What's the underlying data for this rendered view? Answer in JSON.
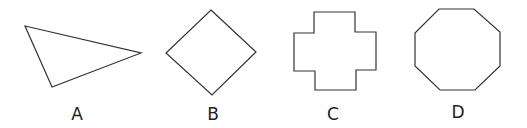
{
  "figure": {
    "stroke_color": "#333333",
    "shapes": [
      {
        "label": "A",
        "name": "triangle",
        "points": "25,26 141,53 52,87",
        "label_x": 77,
        "label_y": 106
      },
      {
        "label": "B",
        "name": "square-diamond",
        "points": "211,10 256,52 212,95 166,53",
        "label_x": 213,
        "label_y": 106
      },
      {
        "label": "C",
        "name": "cross",
        "points": "314,12 355,12 355,32 376,32 376,70 356,70 356,90 315,90 315,71 294,71 294,33 314,33",
        "label_x": 333,
        "label_y": 106
      },
      {
        "label": "D",
        "name": "octagon",
        "points": "439,9 474,9 500,32 500,66 475,90 440,90 415,66 415,33",
        "label_x": 458,
        "label_y": 104
      }
    ]
  }
}
